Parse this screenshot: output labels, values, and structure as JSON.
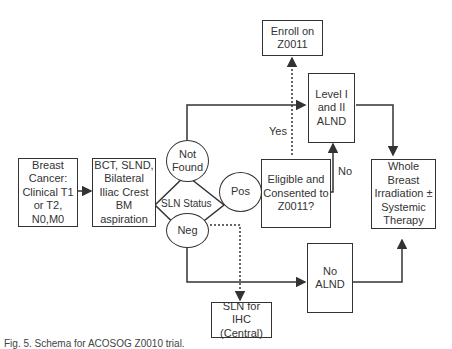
{
  "diagram": {
    "nodes": {
      "breast_cancer": "Breast Cancer: Clinical T1 or T2, N0,M0",
      "bct": "BCT, SLND, Bilateral Iliac Crest BM aspiration",
      "not_found": "Not Found",
      "sln_status": "SLN Status",
      "pos": "Pos",
      "neg": "Neg",
      "eligible": "Eligible and Consented to Z0011?",
      "enroll": "Enroll on Z0011",
      "alnd": "Level I and II ALND",
      "whole_breast": "Whole Breast Irradiation ± Systemic Therapy",
      "no_alnd": "No ALND",
      "sln_ihc": "SLN for IHC (Central)"
    },
    "edge_labels": {
      "yes": "Yes",
      "no": "No"
    },
    "caption": "Fig. 5. Schema for ACOSOG Z0010 trial."
  },
  "colors": {
    "line": "#333333",
    "background": "#ffffff"
  }
}
